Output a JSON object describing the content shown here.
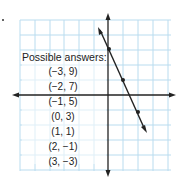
{
  "title": "Possible answers:",
  "answers": [
    "(−3, 9)",
    "(−2, 7)",
    "(−1, 5)",
    "(0, 3)",
    "(1, 1)",
    "(2, −1)",
    "(3, −3)"
  ],
  "graph": {
    "grid_color": "#b9dcef",
    "axis_color": "#222222",
    "line_color": "#222222",
    "line_equation": "y = -2x + 3",
    "marked_points": [
      [
        0,
        3
      ],
      [
        1,
        1
      ],
      [
        2,
        -1
      ]
    ]
  }
}
